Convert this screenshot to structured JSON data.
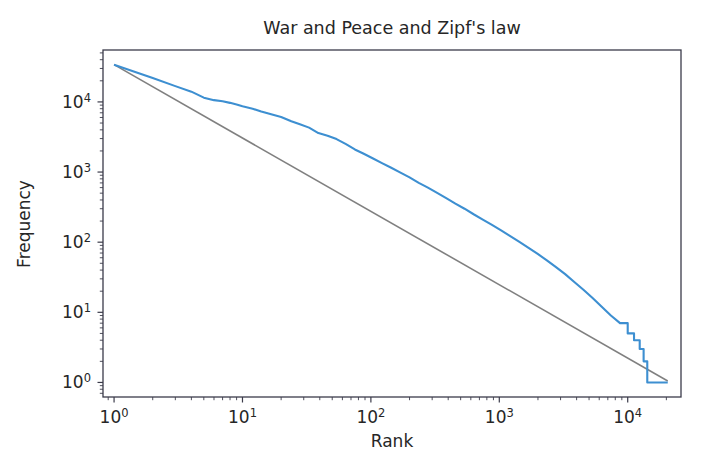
{
  "chart_data": {
    "type": "line",
    "title": "War and Peace and Zipf's law",
    "xlabel": "Rank",
    "ylabel": "Frequency",
    "xscale": "log",
    "yscale": "log",
    "xlim": [
      0.82,
      26000
    ],
    "ylim": [
      0.62,
      55000
    ],
    "grid": false,
    "legend": "none",
    "xticks": [
      1,
      10,
      100,
      1000,
      10000
    ],
    "xticklabels": [
      "10^0",
      "10^1",
      "10^2",
      "10^3",
      "10^4"
    ],
    "yticks": [
      1,
      10,
      100,
      1000,
      10000
    ],
    "yticklabels": [
      "10^0",
      "10^1",
      "10^2",
      "10^3",
      "10^4"
    ],
    "series": [
      {
        "name": "word frequencies",
        "color": "#3d8fd1",
        "linewidth": 2.1,
        "x": [
          1,
          2,
          3,
          4,
          5,
          6,
          7,
          8,
          9,
          10,
          12,
          14,
          17,
          20,
          24,
          28,
          33,
          39,
          46,
          54,
          64,
          75,
          88,
          104,
          122,
          144,
          170,
          200,
          236,
          278,
          328,
          386,
          455,
          536,
          631,
          744,
          877,
          1033,
          1217,
          1434,
          1690,
          1991,
          2346,
          2764,
          3257,
          3837,
          4521,
          5327,
          6276,
          7395,
          8713,
          10000,
          11200,
          12400,
          13300,
          13800,
          14200,
          20500
        ],
        "y": [
          34000,
          22000,
          16800,
          14000,
          11500,
          10600,
          10200,
          9700,
          9200,
          8700,
          8000,
          7300,
          6600,
          6100,
          5300,
          4800,
          4300,
          3600,
          3300,
          2950,
          2500,
          2100,
          1820,
          1560,
          1340,
          1150,
          980,
          840,
          700,
          600,
          505,
          425,
          355,
          300,
          250,
          210,
          176,
          147,
          122,
          101,
          83,
          68,
          55,
          44,
          35,
          27,
          21,
          16,
          12,
          9,
          7,
          5,
          4,
          3,
          2,
          2,
          1,
          1
        ]
      },
      {
        "name": "Zipf's law",
        "color": "#808080",
        "linewidth": 1.6,
        "x": [
          1,
          20500
        ],
        "y": [
          34000,
          1.05
        ]
      }
    ]
  },
  "axes": {
    "plot_left": 103,
    "plot_right": 681,
    "plot_top": 50,
    "plot_bottom": 397
  }
}
